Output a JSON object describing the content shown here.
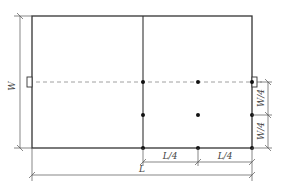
{
  "diagram": {
    "labels": {
      "width": "W",
      "length": "L",
      "quarter_length_1": "L/4",
      "quarter_length_2": "L/4",
      "quarter_width_1": "W/4",
      "quarter_width_2": "W/4"
    },
    "colors": {
      "outline": "#333333",
      "dimension": "#555555",
      "dashed": "#888888",
      "points": "#111111"
    }
  }
}
